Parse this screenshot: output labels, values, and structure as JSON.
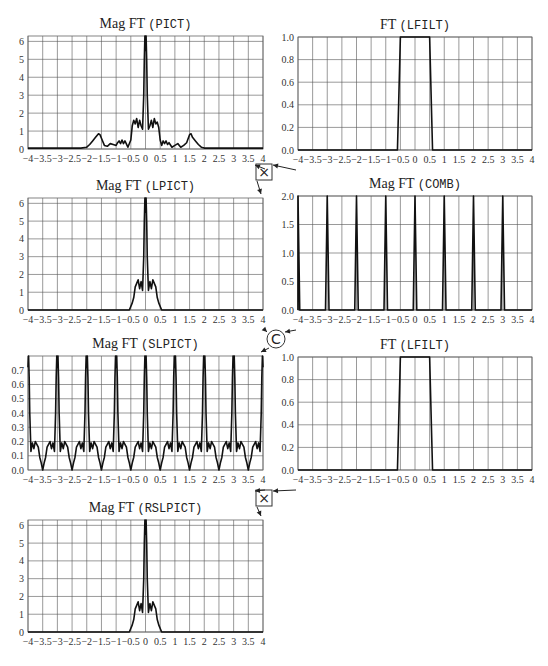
{
  "figure": {
    "width": 548,
    "height": 666,
    "colors": {
      "trace": "#111111",
      "grid": "#555555",
      "background": "#ffffff"
    }
  },
  "operators": [
    {
      "name": "multiply-operator",
      "symbol": "×",
      "shape": "square",
      "x": 264,
      "y": 172,
      "inputs": [
        "plot_pict",
        "plot_lfilt_1"
      ],
      "output": "plot_lpict"
    },
    {
      "name": "convolve-operator",
      "symbol": "C",
      "shape": "circle",
      "x": 276,
      "y": 339,
      "inputs": [
        "plot_lpict",
        "plot_comb"
      ],
      "output": "plot_slpict"
    },
    {
      "name": "multiply-operator-2",
      "symbol": "×",
      "shape": "square",
      "x": 264,
      "y": 498,
      "inputs": [
        "plot_slpict",
        "plot_lfilt_2"
      ],
      "output": "plot_rslpict"
    }
  ],
  "chart_data": [
    {
      "id": "plot_pict",
      "type": "line",
      "title_prefix": "Mag FT ",
      "title_var": "(PICT)",
      "box": {
        "x0": 28,
        "x1": 263,
        "y0": 36,
        "y1": 149
      },
      "xlim": [
        -4,
        4
      ],
      "ylim": [
        0,
        6.3
      ],
      "xticks": [
        -4,
        -3.5,
        -3,
        -2.5,
        -2,
        -1.5,
        -1,
        -0.5,
        0,
        0.5,
        1,
        1.5,
        2,
        2.5,
        3,
        3.5,
        4
      ],
      "xtick_labels": [
        "−4",
        "−3.5",
        "−3",
        "−2.5",
        "−2",
        "−1.5",
        "−1",
        "−0.5",
        "0",
        "0.5",
        "1",
        "1.5",
        "2",
        "2.5",
        "3",
        "3.5",
        "4"
      ],
      "yticks": [
        0,
        1,
        2,
        3,
        4,
        5,
        6
      ],
      "ytick_labels": [
        "0",
        "1",
        "2",
        "3",
        "4",
        "5",
        "6"
      ],
      "grid": true,
      "x": [
        -4,
        -3,
        -2.2,
        -2.0,
        -1.9,
        -1.8,
        -1.7,
        -1.6,
        -1.55,
        -1.5,
        -1.4,
        -1.3,
        -1.2,
        -1.1,
        -1.0,
        -0.95,
        -0.9,
        -0.85,
        -0.8,
        -0.75,
        -0.7,
        -0.6,
        -0.5,
        -0.45,
        -0.4,
        -0.35,
        -0.3,
        -0.25,
        -0.2,
        -0.15,
        -0.1,
        -0.06,
        -0.04,
        -0.02,
        0,
        0.02,
        0.04,
        0.06,
        0.1,
        0.15,
        0.2,
        0.25,
        0.3,
        0.35,
        0.4,
        0.45,
        0.5,
        0.55,
        0.6,
        0.65,
        0.7,
        0.75,
        0.8,
        0.9,
        1.0,
        1.1,
        1.2,
        1.3,
        1.4,
        1.5,
        1.55,
        1.6,
        1.7,
        1.8,
        1.9,
        2.0,
        2.2,
        3,
        4
      ],
      "y": [
        0.05,
        0.05,
        0.05,
        0.1,
        0.25,
        0.45,
        0.65,
        0.85,
        0.8,
        0.6,
        0.2,
        0.15,
        0.3,
        0.25,
        0.2,
        0.35,
        0.45,
        0.3,
        0.5,
        0.3,
        0.45,
        0.1,
        0.5,
        1.3,
        1.6,
        1.4,
        1.7,
        1.2,
        1.6,
        1.3,
        1.1,
        3.0,
        5.0,
        6.3,
        5.5,
        6.3,
        5.0,
        3.0,
        1.1,
        1.3,
        1.6,
        1.2,
        1.7,
        1.4,
        1.5,
        1.2,
        0.5,
        0.2,
        0.45,
        0.3,
        0.45,
        0.25,
        0.35,
        0.1,
        0.2,
        0.3,
        0.1,
        0.2,
        0.35,
        0.8,
        0.85,
        0.65,
        0.45,
        0.25,
        0.1,
        0.05,
        0.05,
        0.05,
        0.05
      ]
    },
    {
      "id": "plot_lfilt_1",
      "type": "line",
      "title_prefix": "FT ",
      "title_var": "(LFILT)",
      "box": {
        "x0": 298,
        "x1": 532,
        "y0": 37,
        "y1": 150
      },
      "xlim": [
        -4,
        4
      ],
      "ylim": [
        0,
        1.0
      ],
      "xticks": [
        -4,
        -3.5,
        -3,
        -2.5,
        -2,
        -1.5,
        -1,
        -0.5,
        0,
        0.5,
        1,
        1.5,
        2,
        2.5,
        3,
        3.5,
        4
      ],
      "xtick_labels": [
        "−4",
        "−3.5",
        "−3",
        "−2.5",
        "−2",
        "−1.5",
        "−1",
        "−0.5",
        "0",
        "0.5",
        "1",
        "1.5",
        "2",
        "2.5",
        "3",
        "3.5",
        "4"
      ],
      "yticks": [
        0,
        0.2,
        0.4,
        0.6,
        0.8,
        1.0
      ],
      "ytick_labels": [
        "0.0",
        "0.2",
        "0.4",
        "0.6",
        "0.8",
        "1.0"
      ],
      "grid": true,
      "x": [
        -4,
        -0.6,
        -0.5,
        0.5,
        0.6,
        4
      ],
      "y": [
        0,
        0,
        1,
        1,
        0,
        0
      ]
    },
    {
      "id": "plot_lpict",
      "type": "line",
      "title_prefix": "Mag FT ",
      "title_var": "(LPICT)",
      "box": {
        "x0": 28,
        "x1": 263,
        "y0": 198,
        "y1": 310
      },
      "xlim": [
        -4,
        4
      ],
      "ylim": [
        0,
        6.3
      ],
      "xticks": [
        -4,
        -3.5,
        -3,
        -2.5,
        -2,
        -1.5,
        -1,
        -0.5,
        0,
        0.5,
        1,
        1.5,
        2,
        2.5,
        3,
        3.5,
        4
      ],
      "xtick_labels": [
        "−4",
        "−3.5",
        "−3",
        "−2.5",
        "−2",
        "−1.5",
        "−1",
        "−0.5",
        "0",
        "0.5",
        "1",
        "1.5",
        "2",
        "2.5",
        "3",
        "3.5",
        "4"
      ],
      "yticks": [
        0,
        1,
        2,
        3,
        4,
        5,
        6
      ],
      "ytick_labels": [
        "0",
        "1",
        "2",
        "3",
        "4",
        "5",
        "6"
      ],
      "grid": true,
      "x": [
        -4,
        -0.55,
        -0.45,
        -0.4,
        -0.35,
        -0.3,
        -0.25,
        -0.2,
        -0.15,
        -0.1,
        -0.06,
        -0.04,
        -0.02,
        0,
        0.02,
        0.04,
        0.06,
        0.1,
        0.15,
        0.2,
        0.25,
        0.3,
        0.35,
        0.4,
        0.45,
        0.55,
        4
      ],
      "y": [
        0,
        0,
        0.4,
        0.7,
        1.3,
        1.5,
        1.7,
        1.2,
        1.6,
        1.1,
        3.0,
        5.0,
        6.3,
        5.5,
        6.3,
        5.0,
        3.0,
        1.1,
        1.6,
        1.2,
        1.7,
        1.5,
        1.3,
        0.7,
        0.4,
        0,
        0
      ]
    },
    {
      "id": "plot_comb",
      "type": "line",
      "title_prefix": "Mag FT ",
      "title_var": "(COMB)",
      "box": {
        "x0": 298,
        "x1": 532,
        "y0": 196,
        "y1": 310
      },
      "xlim": [
        -4,
        4
      ],
      "ylim": [
        0,
        2.0
      ],
      "xticks": [
        -4,
        -3.5,
        -3,
        -2.5,
        -2,
        -1.5,
        -1,
        -0.5,
        0,
        0.5,
        1,
        1.5,
        2,
        2.5,
        3,
        3.5,
        4
      ],
      "xtick_labels": [
        "−4",
        "−3.5",
        "−3",
        "−2.5",
        "−2",
        "−1.5",
        "−1",
        "−0.5",
        "0",
        "0.5",
        "1",
        "1.5",
        "2",
        "2.5",
        "3",
        "3.5",
        "4"
      ],
      "yticks": [
        0,
        0.5,
        1.0,
        1.5,
        2.0
      ],
      "ytick_labels": [
        "0.0",
        "0.5",
        "1.0",
        "1.5",
        "2.0"
      ],
      "grid": true,
      "impulses": [
        -4,
        -3,
        -2,
        -1,
        0,
        1,
        2,
        3
      ],
      "impulse_height": 2.0,
      "impulse_halfwidth": 0.06
    },
    {
      "id": "plot_slpict",
      "type": "line",
      "title_prefix": "Mag FT ",
      "title_var": "(SLPICT)",
      "box": {
        "x0": 28,
        "x1": 263,
        "y0": 356,
        "y1": 470
      },
      "xlim": [
        -4,
        4
      ],
      "ylim": [
        0,
        0.8
      ],
      "xticks": [
        -4,
        -3.5,
        -3,
        -2.5,
        -2,
        -1.5,
        -1,
        -0.5,
        0,
        0.5,
        1,
        1.5,
        2,
        2.5,
        3,
        3.5,
        4
      ],
      "xtick_labels": [
        "−4",
        "−3.5",
        "−3",
        "−2.5",
        "−2",
        "−1.5",
        "−1",
        "−0.5",
        "0",
        "0.5",
        "1",
        "1.5",
        "2",
        "2.5",
        "3",
        "3.5",
        "4"
      ],
      "yticks": [
        0,
        0.1,
        0.2,
        0.3,
        0.4,
        0.5,
        0.6,
        0.7
      ],
      "ytick_labels": [
        "0.0",
        "0.1",
        "0.2",
        "0.3",
        "0.4",
        "0.5",
        "0.6",
        "0.7"
      ],
      "grid": true,
      "periodic": {
        "period": 1.0,
        "centers": [
          -4,
          -3,
          -2,
          -1,
          0,
          1,
          2,
          3,
          4
        ],
        "lobe_x": [
          -0.5,
          -0.45,
          -0.4,
          -0.35,
          -0.3,
          -0.25,
          -0.2,
          -0.15,
          -0.1,
          -0.06,
          -0.04,
          -0.02,
          0,
          0.02,
          0.04,
          0.06,
          0.1,
          0.15,
          0.2,
          0.25,
          0.3,
          0.35,
          0.4,
          0.45,
          0.5
        ],
        "lobe_y": [
          0.0,
          0.05,
          0.09,
          0.16,
          0.18,
          0.2,
          0.15,
          0.19,
          0.13,
          0.4,
          0.65,
          0.8,
          0.72,
          0.8,
          0.65,
          0.4,
          0.13,
          0.19,
          0.15,
          0.2,
          0.18,
          0.16,
          0.09,
          0.05,
          0.0
        ]
      }
    },
    {
      "id": "plot_lfilt_2",
      "type": "line",
      "title_prefix": "FT ",
      "title_var": "(LFILT)",
      "box": {
        "x0": 298,
        "x1": 532,
        "y0": 357,
        "y1": 470
      },
      "xlim": [
        -4,
        4
      ],
      "ylim": [
        0,
        1.0
      ],
      "xticks": [
        -4,
        -3.5,
        -3,
        -2.5,
        -2,
        -1.5,
        -1,
        -0.5,
        0,
        0.5,
        1,
        1.5,
        2,
        2.5,
        3,
        3.5,
        4
      ],
      "xtick_labels": [
        "−4",
        "−3.5",
        "−3",
        "−2.5",
        "−2",
        "−1.5",
        "−1",
        "−0.5",
        "0",
        "0.5",
        "1",
        "1.5",
        "2",
        "2.5",
        "3",
        "3.5",
        "4"
      ],
      "yticks": [
        0,
        0.2,
        0.4,
        0.6,
        0.8,
        1.0
      ],
      "ytick_labels": [
        "0.0",
        "0.2",
        "0.4",
        "0.6",
        "0.8",
        "1.0"
      ],
      "grid": true,
      "x": [
        -4,
        -0.6,
        -0.5,
        0.5,
        0.6,
        4
      ],
      "y": [
        0,
        0,
        1,
        1,
        0,
        0
      ]
    },
    {
      "id": "plot_rslpict",
      "type": "line",
      "title_prefix": "Mag FT ",
      "title_var": "(RSLPICT)",
      "box": {
        "x0": 28,
        "x1": 263,
        "y0": 520,
        "y1": 632
      },
      "xlim": [
        -4,
        4
      ],
      "ylim": [
        0,
        6.3
      ],
      "xticks": [
        -4,
        -3.5,
        -3,
        -2.5,
        -2,
        -1.5,
        -1,
        -0.5,
        0,
        0.5,
        1,
        1.5,
        2,
        2.5,
        3,
        3.5,
        4
      ],
      "xtick_labels": [
        "−4",
        "−3.5",
        "−3",
        "−2.5",
        "−2",
        "−1.5",
        "−1",
        "−0.5",
        "0",
        "0.5",
        "1",
        "1.5",
        "2",
        "2.5",
        "3",
        "3.5",
        "4"
      ],
      "yticks": [
        0,
        1,
        2,
        3,
        4,
        5,
        6
      ],
      "ytick_labels": [
        "0",
        "1",
        "2",
        "3",
        "4",
        "5",
        "6"
      ],
      "grid": true,
      "x": [
        -4,
        -0.55,
        -0.45,
        -0.4,
        -0.35,
        -0.3,
        -0.25,
        -0.2,
        -0.15,
        -0.1,
        -0.06,
        -0.04,
        -0.02,
        0,
        0.02,
        0.04,
        0.06,
        0.1,
        0.15,
        0.2,
        0.25,
        0.3,
        0.35,
        0.4,
        0.45,
        0.55,
        4
      ],
      "y": [
        0,
        0,
        0.4,
        0.7,
        1.3,
        1.5,
        1.7,
        1.2,
        1.6,
        1.1,
        3.0,
        5.0,
        6.3,
        5.5,
        6.3,
        5.0,
        3.0,
        1.1,
        1.6,
        1.2,
        1.7,
        1.5,
        1.3,
        0.7,
        0.4,
        0,
        0
      ]
    }
  ]
}
